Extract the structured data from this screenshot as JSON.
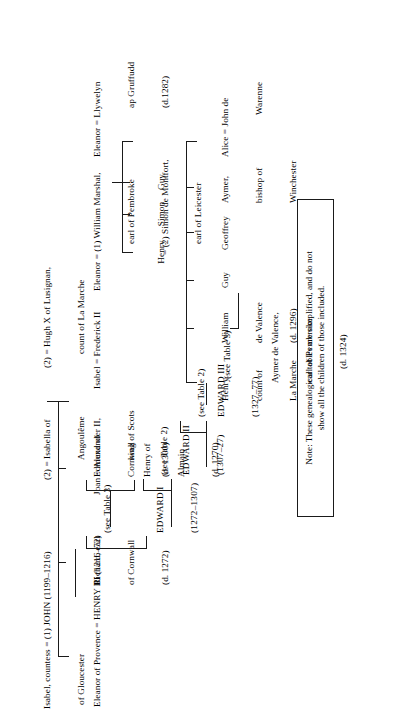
{
  "document": {
    "type": "genealogical-table",
    "orientation": "rotated-90-ccw",
    "title": "Genealogical table of the Plantagenet/Angevin descendants of King John"
  },
  "generation_1": {
    "isabel_gloucester": "Isabel, countess = (1) JOHN (1199–1216)\n   of Gloucester",
    "isabel_gloucester_line1": "Isabel, countess = (1) JOHN (1199–1216)",
    "isabel_gloucester_line2": "of Gloucester",
    "isabella_angouleme_line1": "(2) = Isabella of",
    "isabella_angouleme_line2": "Angoulême",
    "hugh_lusignan_line1": "(2) = Hugh X of Lusignan,",
    "hugh_lusignan_line2": "count of La Marche"
  },
  "generation_2": {
    "henry_iii_line1": "Eleanor of Provence = HENRY III (1216–72)",
    "richard_cornwall_line1": "Richard, earl",
    "richard_cornwall_line2": "of Cornwall",
    "richard_cornwall_line3": "(d. 1272)",
    "joan_alexander_line1": "Joan = Alexander II,",
    "joan_alexander_line2": "king of Scots",
    "isabel_frederick_line1": "Isabel = Frederick II",
    "eleanor_marshal_line1": "Eleanor = (1) William Marshal,",
    "eleanor_marshal_line2": "earl of Pembroke",
    "eleanor_marshal_line3": "= (2) Simon de Montfort,",
    "eleanor_marshal_line4": "earl of Leicester"
  },
  "generation_3": {
    "edward_i_line1": "EDWARD I",
    "edward_i_line2": "(1272–1307)",
    "see_table_3_a": "(see Table 3)",
    "henry_almain_line1": "Henry of",
    "henry_almain_line2": "Almain",
    "henry_almain_line3": "(d. 1270)",
    "edmund_cornwall_line1": "Edmund of",
    "edmund_cornwall_line2": "Cornwall",
    "edmund_cornwall_line3": "(d. 1300)",
    "montfort_children": "Henry  Simon  Guy",
    "montfort_henry": "Henry",
    "montfort_simon": "Simon",
    "montfort_guy": "Guy",
    "eleanor_llywelyn_line1": "Eleanor = Llywelyn",
    "eleanor_llywelyn_line2": "ap Gruffudd",
    "eleanor_llywelyn_line3": "(d.1282)",
    "lusignan_henry_line1": "Henry,",
    "lusignan_henry_line2": "count of",
    "lusignan_henry_line3": "La Marche",
    "william_valence_line1": "William",
    "william_valence_line2": "de Valence",
    "william_valence_line3": "(d. 1296)",
    "lusignan_guy": "Guy",
    "lusignan_geoffrey": "Geoffrey",
    "aymer_winchester_line1": "Aymer,",
    "aymer_winchester_line2": "bishop of",
    "aymer_winchester_line3": "Winchester",
    "alice_warenne_line1": "Alice = John de",
    "alice_warenne_line2": "Warenne"
  },
  "generation_4": {
    "edward_ii_line1": "EDWARD II",
    "edward_ii_line2": "(1307–27)",
    "see_table_2_a": "(see Table 2)",
    "see_table_2_b": "(see Table 2)",
    "aymer_valence_line1": "Aymer de Valence,",
    "aymer_valence_line2": "earl of Pembroke",
    "aymer_valence_line3": "(d. 1324)"
  },
  "generation_5": {
    "edward_iii_line1": "EDWARD III",
    "edward_iii_line2": "(1327–77)",
    "see_table_3_b": "(see Table 3)"
  },
  "note": {
    "line1": "Note: These genealogical tables are simplified, and do not",
    "line2": "show all the children of those included."
  }
}
